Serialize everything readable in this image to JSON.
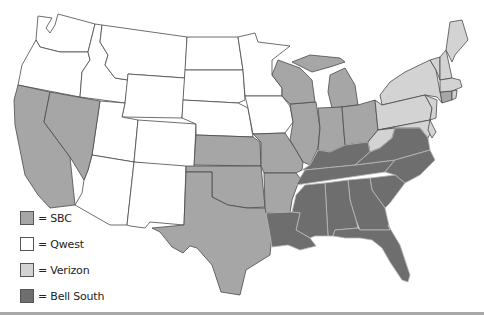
{
  "map": {
    "title": "US Regional Bell Operating Companies",
    "colors": {
      "SBC": "#a6a6a6",
      "Qwest": "#ffffff",
      "Verizon": "#d3d3d3",
      "BellSouth": "#6e6e6e"
    },
    "regions": {
      "Qwest": [
        "WA",
        "OR",
        "ID",
        "MT",
        "WY",
        "UT",
        "CO",
        "AZ",
        "NM",
        "ND",
        "SD",
        "NE",
        "MN",
        "IA"
      ],
      "SBC": [
        "CA",
        "NV",
        "KS",
        "OK",
        "TX",
        "MO",
        "AR",
        "IL",
        "WI",
        "MI",
        "IN",
        "OH",
        "CT"
      ],
      "Verizon": [
        "NY",
        "PA",
        "NJ",
        "MD",
        "DE",
        "WV",
        "VA-none",
        "VT",
        "NH",
        "ME",
        "MA",
        "RI"
      ],
      "BellSouth": [
        "KY",
        "TN",
        "NC",
        "SC",
        "GA",
        "FL",
        "AL",
        "MS",
        "LA",
        "VA"
      ]
    }
  },
  "legend": {
    "items": [
      {
        "label": "= SBC",
        "color": "#a6a6a6"
      },
      {
        "label": "= Qwest",
        "color": "#ffffff"
      },
      {
        "label": "= Verizon",
        "color": "#d3d3d3"
      },
      {
        "label": "= Bell South",
        "color": "#6e6e6e"
      }
    ]
  }
}
